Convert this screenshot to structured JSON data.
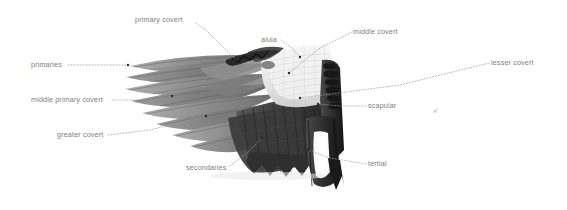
{
  "figure": {
    "background_color": "#ffffff",
    "label_color": "#7d7d7d",
    "leader_color": "#9a9a9a",
    "width": 567,
    "height": 210
  },
  "labels": [
    {
      "id": "primary-covert",
      "text": "primary covert",
      "x": 135,
      "y": 15,
      "align": "left"
    },
    {
      "id": "alula",
      "text": "alula",
      "x": 261,
      "y": 35,
      "align": "left"
    },
    {
      "id": "middle-covert",
      "text": "middle covert",
      "x": 353,
      "y": 27,
      "align": "left"
    },
    {
      "id": "lesser-covert",
      "text": "lesser covert",
      "x": 491,
      "y": 58,
      "align": "left"
    },
    {
      "id": "primaries",
      "text": "primaries",
      "x": 31,
      "y": 60,
      "align": "left"
    },
    {
      "id": "middle-primary-covert",
      "text": "middle primary covert",
      "x": 31,
      "y": 95,
      "align": "left"
    },
    {
      "id": "greater-covert",
      "text": "greater covert",
      "x": 57,
      "y": 130,
      "align": "left"
    },
    {
      "id": "secondaries",
      "text": "secondaries",
      "x": 186,
      "y": 163,
      "align": "left"
    },
    {
      "id": "scapular",
      "text": "scapular",
      "x": 368,
      "y": 101,
      "align": "left"
    },
    {
      "id": "tertial",
      "text": "tertial",
      "x": 368,
      "y": 159,
      "align": "left"
    }
  ],
  "leaders": [
    {
      "id": "leader-primary-covert",
      "path": "M 196 23 L 206 30 L 236 60",
      "style": "dashed",
      "dot": [
        236,
        60
      ]
    },
    {
      "id": "leader-alula",
      "path": "M 281 40 L 292 48 L 300 57",
      "style": "dashed",
      "dot": [
        300,
        57
      ]
    },
    {
      "id": "leader-middle-covert",
      "path": "M 352 32 L 320 48 L 289 73",
      "style": "dashed",
      "dot": [
        289,
        73
      ]
    },
    {
      "id": "leader-lesser-covert",
      "path": "M 489 63 L 400 85 L 300 98",
      "style": "dashed",
      "dot": [
        300,
        98
      ]
    },
    {
      "id": "leader-primaries",
      "path": "M 68 65 L 128 65",
      "style": "dashed",
      "dot": [
        128,
        65
      ]
    },
    {
      "id": "leader-middle-primary-covert",
      "path": "M 112 100 L 148 100 L 172 96",
      "style": "dashed",
      "dot": [
        172,
        96
      ]
    },
    {
      "id": "leader-greater-covert",
      "path": "M 108 135 L 150 130 L 206 116",
      "style": "dashed",
      "dot": [
        206,
        116
      ]
    },
    {
      "id": "leader-secondaries",
      "path": "M 230 166 L 248 152 L 262 138",
      "style": "dashed",
      "dot": [
        262,
        138
      ]
    },
    {
      "id": "leader-scapular",
      "path": "M 366 106 L 340 106 L 318 104",
      "style": "dashed",
      "dot": [
        318,
        104
      ]
    },
    {
      "id": "leader-tertial",
      "path": "M 366 164 L 330 158 L 308 150",
      "style": "dashed",
      "dot": [
        308,
        150
      ]
    }
  ],
  "wing": {
    "description": "grayscale bird wing, spread, pointing left with primaries fanned",
    "palette": {
      "primary_light": "#b4b4b4",
      "primary_mid": "#8c8c8c",
      "primary_dark": "#5e5e5e",
      "covert_light": "#e9e9e9",
      "covert_white": "#f6f6f6",
      "secondary_dark": "#3f3f3f",
      "shadow_black": "#1c1c1c",
      "patch_white": "#fafafa"
    }
  }
}
